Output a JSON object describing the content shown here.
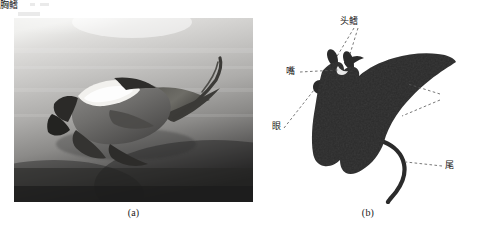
{
  "figure": {
    "panels": [
      {
        "id": "a",
        "caption": "(a)",
        "type": "photograph",
        "subject": "manta-ray-underwater-photo"
      },
      {
        "id": "b",
        "caption": "(b)",
        "type": "labeled-silhouette-diagram",
        "subject": "manta-ray-anatomy-silhouette"
      }
    ]
  },
  "diagram": {
    "labels": {
      "head_fin": "头鳍",
      "mouth": "嘴",
      "eye": "眼",
      "pectoral_fin": "胸鳍",
      "tail": "尾"
    }
  },
  "colors": {
    "page_background": "#ffffff",
    "silhouette": "#2b2b2b",
    "leader_line": "#555555",
    "caption_text": "#1a1a1a",
    "label_text": "#141414",
    "photo_water_light": "#d9d9d6",
    "photo_water_dark": "#2a2a2a"
  }
}
